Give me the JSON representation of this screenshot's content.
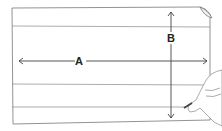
{
  "diagram": {
    "labels": {
      "width_label": "A",
      "height_label": "B"
    },
    "colors": {
      "line": "#555555",
      "paper": "#ffffff"
    }
  }
}
